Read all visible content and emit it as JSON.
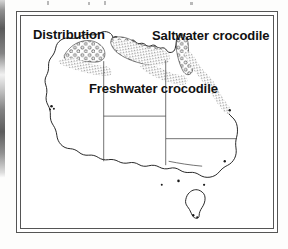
{
  "figure": {
    "title": "Distribution",
    "frame_style": "double-rule-rectangle"
  },
  "labels": {
    "distribution": "Distribution",
    "saltwater": "Saltwater crocodile",
    "freshwater": "Freshwater crocodile"
  },
  "legend_patterns": [
    {
      "name": "saltwater-crocodile-range",
      "label": "Saltwater crocodile",
      "symbol": "fine-stipple-dots",
      "color": "#1a1a1a",
      "region": "northern and north-eastern coastal strip, Kimberley to Cape York and down the Queensland coast"
    },
    {
      "name": "freshwater-crocodile-range",
      "label": "Freshwater crocodile",
      "symbol": "open-circles",
      "color": "#1a1a1a",
      "region": "inland northern Australia, Kimberley, Top End and Cape York"
    }
  ],
  "map": {
    "landmass": "Australia",
    "coastline_color": "#1a1a1a",
    "border_color": "#3a3a3a",
    "fill_color": "#ffffff",
    "islands": [
      "Tasmania"
    ],
    "internal_borders": 5
  },
  "colors": {
    "ink": "#1a1a1a",
    "frame": "#555555",
    "paper": "#ffffff",
    "scan_edge": "#3c3c3c"
  }
}
